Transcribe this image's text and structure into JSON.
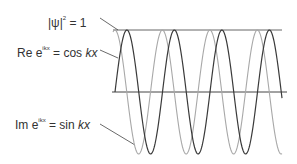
{
  "labels": {
    "norm": {
      "lhs": "|ψ|",
      "exp": "2",
      "rhs": " = 1"
    },
    "real": {
      "pre": "Re e",
      "exp": "ikx",
      "mid": " = cos ",
      "var": "kx"
    },
    "imag": {
      "pre": "Im e",
      "exp": "ikx",
      "mid": " = sin ",
      "var": "kx"
    }
  },
  "colors": {
    "real_wave": "#3a3a3a",
    "imag_wave": "#a8a8a8",
    "axis_lines": "#555555",
    "text": "#333333"
  },
  "waves": {
    "x_start": 113,
    "x_end": 282,
    "axis_y": 92,
    "amplitude": 62,
    "period": 47.5
  }
}
